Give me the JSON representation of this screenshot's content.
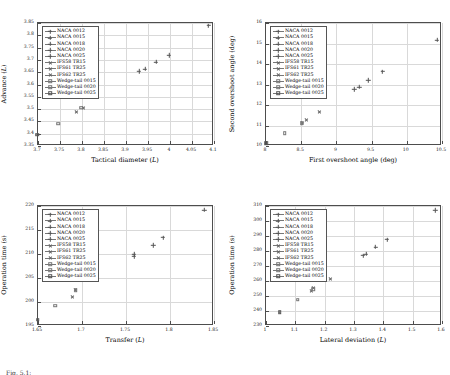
{
  "figure": {
    "caption": "Fig. 5.1:",
    "series_names": [
      "NACA 0012",
      "NACA 0015",
      "NACA 0018",
      "NACA 0020",
      "NACA 0025",
      "IFS58 TR15",
      "IFS61 TR25",
      "IFS62 TR25",
      "Wedge-tail 0015",
      "Wedge-tail 0020",
      "Wedge-tail 0025"
    ],
    "marker_styles": [
      "cross",
      "cross",
      "cross",
      "cross",
      "cross",
      "ex",
      "ex",
      "ex",
      "square",
      "square",
      "square-dot"
    ]
  },
  "chart_data": [
    {
      "id": "advance-vs-tactical-diameter",
      "type": "scatter",
      "title": "",
      "xlabel": "Tactical diameter (L)",
      "ylabel": "Advance (L)",
      "xlim": [
        3.7,
        4.1
      ],
      "ylim": [
        3.35,
        3.85
      ],
      "xticks": [
        3.7,
        3.75,
        3.8,
        3.85,
        3.9,
        3.95,
        4,
        4.05,
        4.1
      ],
      "yticks": [
        3.35,
        3.4,
        3.45,
        3.5,
        3.55,
        3.6,
        3.65,
        3.7,
        3.75,
        3.8,
        3.85
      ],
      "xticklabels": [
        "3.7",
        "3.75",
        "3.8",
        "3.85",
        "3.9",
        "3.95",
        "4",
        "4.05",
        "4.1"
      ],
      "yticklabels": [
        "3.35",
        "3.4",
        "3.45",
        "3.5",
        "3.55",
        "3.6",
        "3.65",
        "3.7",
        "3.75",
        "3.8",
        "3.85"
      ],
      "grid": true,
      "legend_position": "upper-left",
      "points": [
        {
          "name": "NACA 0012",
          "marker": "cross",
          "x": 4.09,
          "y": 3.835
        },
        {
          "name": "NACA 0015",
          "marker": "cross",
          "x": 4.0,
          "y": 3.715
        },
        {
          "name": "NACA 0018",
          "marker": "cross",
          "x": 3.97,
          "y": 3.688
        },
        {
          "name": "NACA 0020",
          "marker": "cross",
          "x": 3.945,
          "y": 3.659
        },
        {
          "name": "NACA 0025",
          "marker": "cross",
          "x": 3.932,
          "y": 3.65
        },
        {
          "name": "IFS58 TR15",
          "marker": "ex",
          "x": 3.802,
          "y": 3.552
        },
        {
          "name": "IFS61 TR25",
          "marker": "ex",
          "x": 3.806,
          "y": 3.501
        },
        {
          "name": "IFS62 TR25",
          "marker": "ex",
          "x": 3.79,
          "y": 3.486
        },
        {
          "name": "Wedge-tail 0015",
          "marker": "square",
          "x": 3.8,
          "y": 3.501
        },
        {
          "name": "Wedge-tail 0020",
          "marker": "square",
          "x": 3.748,
          "y": 3.437
        },
        {
          "name": "Wedge-tail 0025",
          "marker": "square-dot",
          "x": 3.7,
          "y": 3.392
        }
      ]
    },
    {
      "id": "second-vs-first-overshoot-angle",
      "type": "scatter",
      "title": "",
      "xlabel": "First overshoot angle (deg)",
      "ylabel": "Second overshoot angle (deg)",
      "xlim": [
        8,
        10.5
      ],
      "ylim": [
        10,
        16
      ],
      "xticks": [
        8,
        8.5,
        9,
        9.5,
        10,
        10.5
      ],
      "yticks": [
        10,
        11,
        12,
        13,
        14,
        15,
        16
      ],
      "xticklabels": [
        "8",
        "8.5",
        "9",
        "9.5",
        "10",
        "10.5"
      ],
      "yticklabels": [
        "10",
        "11",
        "12",
        "13",
        "14",
        "15",
        "16"
      ],
      "grid": true,
      "legend_position": "upper-left",
      "points": [
        {
          "name": "NACA 0012",
          "marker": "cross",
          "x": 10.44,
          "y": 15.12
        },
        {
          "name": "NACA 0015",
          "marker": "cross",
          "x": 9.67,
          "y": 13.58
        },
        {
          "name": "NACA 0018",
          "marker": "cross",
          "x": 9.47,
          "y": 13.15
        },
        {
          "name": "NACA 0020",
          "marker": "cross",
          "x": 9.34,
          "y": 12.83
        },
        {
          "name": "NACA 0025",
          "marker": "cross",
          "x": 9.27,
          "y": 12.72
        },
        {
          "name": "IFS58 TR15",
          "marker": "ex",
          "x": 8.77,
          "y": 11.61
        },
        {
          "name": "IFS61 TR25",
          "marker": "ex",
          "x": 8.58,
          "y": 11.2
        },
        {
          "name": "IFS62 TR25",
          "marker": "ex",
          "x": 8.53,
          "y": 11.07
        },
        {
          "name": "Wedge-tail 0015",
          "marker": "square",
          "x": 8.52,
          "y": 11.07
        },
        {
          "name": "Wedge-tail 0020",
          "marker": "square",
          "x": 8.28,
          "y": 10.58
        },
        {
          "name": "Wedge-tail 0025",
          "marker": "square-dot",
          "x": 8.02,
          "y": 10.08
        }
      ]
    },
    {
      "id": "operation-time-vs-transfer",
      "type": "scatter",
      "title": "",
      "xlabel": "Transfer (L)",
      "ylabel": "Operation time (s)",
      "xlim": [
        1.65,
        1.85
      ],
      "ylim": [
        195,
        220
      ],
      "xticks": [
        1.65,
        1.7,
        1.75,
        1.8,
        1.85
      ],
      "yticks": [
        195,
        200,
        205,
        210,
        215,
        220
      ],
      "xticklabels": [
        "1.65",
        "1.7",
        "1.75",
        "1.8",
        "1.85"
      ],
      "yticklabels": [
        "195",
        "200",
        "205",
        "210",
        "215",
        "220"
      ],
      "grid": true,
      "legend_position": "upper-left",
      "points": [
        {
          "name": "NACA 0012",
          "marker": "cross",
          "x": 1.84,
          "y": 219.0
        },
        {
          "name": "NACA 0015",
          "marker": "cross",
          "x": 1.793,
          "y": 213.2
        },
        {
          "name": "NACA 0018",
          "marker": "cross",
          "x": 1.782,
          "y": 211.6
        },
        {
          "name": "NACA 0020",
          "marker": "cross",
          "x": 1.76,
          "y": 209.7
        },
        {
          "name": "NACA 0025",
          "marker": "cross",
          "x": 1.76,
          "y": 209.3
        },
        {
          "name": "IFS58 TR15",
          "marker": "ex",
          "x": 1.719,
          "y": 204.5
        },
        {
          "name": "IFS61 TR25",
          "marker": "ex",
          "x": 1.694,
          "y": 202.2
        },
        {
          "name": "IFS62 TR25",
          "marker": "ex",
          "x": 1.69,
          "y": 200.9
        },
        {
          "name": "Wedge-tail 0015",
          "marker": "square",
          "x": 1.694,
          "y": 202.2
        },
        {
          "name": "Wedge-tail 0020",
          "marker": "square",
          "x": 1.671,
          "y": 199.0
        },
        {
          "name": "Wedge-tail 0025",
          "marker": "square-dot",
          "x": 1.651,
          "y": 196.1
        }
      ]
    },
    {
      "id": "operation-time-vs-lateral-deviation",
      "type": "scatter",
      "title": "",
      "xlabel": "Lateral deviation (L)",
      "ylabel": "Operation time (s)",
      "xlim": [
        1.0,
        1.6
      ],
      "ylim": [
        230,
        310
      ],
      "xticks": [
        1.0,
        1.1,
        1.2,
        1.3,
        1.4,
        1.5,
        1.6
      ],
      "yticks": [
        230,
        240,
        250,
        260,
        270,
        280,
        290,
        300,
        310
      ],
      "xticklabels": [
        "1",
        "1.1",
        "1.2",
        "1.3",
        "1.4",
        "1.5",
        "1.6"
      ],
      "yticklabels": [
        "230",
        "240",
        "250",
        "260",
        "270",
        "280",
        "290",
        "300",
        "310"
      ],
      "grid": true,
      "legend_position": "upper-left",
      "points": [
        {
          "name": "NACA 0012",
          "marker": "cross",
          "x": 1.58,
          "y": 306.5
        },
        {
          "name": "NACA 0015",
          "marker": "cross",
          "x": 1.415,
          "y": 287.0
        },
        {
          "name": "NACA 0018",
          "marker": "cross",
          "x": 1.377,
          "y": 282.0
        },
        {
          "name": "NACA 0020",
          "marker": "cross",
          "x": 1.344,
          "y": 277.5
        },
        {
          "name": "NACA 0025",
          "marker": "cross",
          "x": 1.334,
          "y": 276.2
        },
        {
          "name": "IFS58 TR15",
          "marker": "ex",
          "x": 1.222,
          "y": 261.0
        },
        {
          "name": "IFS61 TR25",
          "marker": "ex",
          "x": 1.166,
          "y": 254.5
        },
        {
          "name": "IFS62 TR25",
          "marker": "ex",
          "x": 1.158,
          "y": 252.5
        },
        {
          "name": "Wedge-tail 0015",
          "marker": "square",
          "x": 1.164,
          "y": 254.0
        },
        {
          "name": "Wedge-tail 0020",
          "marker": "square",
          "x": 1.112,
          "y": 247.0
        },
        {
          "name": "Wedge-tail 0025",
          "marker": "square-dot",
          "x": 1.05,
          "y": 238.5
        }
      ]
    }
  ]
}
